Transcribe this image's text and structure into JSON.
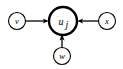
{
  "diagram": {
    "type": "directed-graph",
    "background_color": "#ffffff",
    "stroke_color": "#000000",
    "nodes": [
      {
        "id": "v",
        "label": "v",
        "subscript": "",
        "role": "source",
        "emphasis": "normal",
        "cx": 17,
        "cy": 21,
        "r": 8.5
      },
      {
        "id": "u_j",
        "label": "u",
        "subscript": "j",
        "role": "target",
        "emphasis": "bold",
        "cx": 63,
        "cy": 21,
        "r": 14
      },
      {
        "id": "x",
        "label": "x",
        "subscript": "",
        "role": "source",
        "emphasis": "normal",
        "cx": 107,
        "cy": 21,
        "r": 8.5
      },
      {
        "id": "w",
        "label": "w",
        "subscript": "",
        "role": "source",
        "emphasis": "normal",
        "cx": 62,
        "cy": 56,
        "r": 8.5
      }
    ],
    "edges": [
      {
        "id": "edge-v-uj",
        "from": "v",
        "to": "u_j",
        "direction": "right",
        "arrow": "to-target"
      },
      {
        "id": "edge-x-uj",
        "from": "x",
        "to": "u_j",
        "direction": "left",
        "arrow": "to-target"
      },
      {
        "id": "edge-w-uj",
        "from": "w",
        "to": "u_j",
        "direction": "up",
        "arrow": "to-target"
      }
    ]
  }
}
